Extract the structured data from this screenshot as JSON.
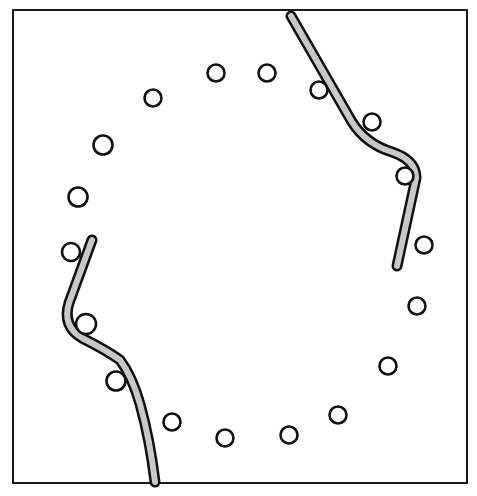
{
  "figure": {
    "colors": {
      "background": "#ffffff",
      "frame_stroke": "#1a1a1a",
      "circle_fill": "#ffffff",
      "circle_stroke": "#111111",
      "band_fill": "#c8c8c8",
      "band_stroke": "#111111"
    },
    "circle_count": 18,
    "band_count": 2
  }
}
